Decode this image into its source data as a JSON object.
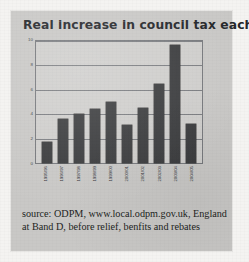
{
  "figure": {
    "title": "Real increase in council tax each year",
    "caption_line_1": "source: ODPM, www.local.odpm.gov.uk, England",
    "caption_line_2": "at Band D, before relief, benfits and rebates"
  },
  "colors": {
    "bar": "#3b3c3e",
    "plot_background": "#cfcecc",
    "figure_background": "#c9c8c6",
    "gridline": "#7b7d81",
    "text": "#1d1f22"
  },
  "chart_data": {
    "type": "bar",
    "title": "Real increase in council tax each year",
    "xlabel": "",
    "ylabel": "",
    "ylim": [
      0,
      10
    ],
    "yticks": [
      0,
      2,
      4,
      6,
      8,
      10
    ],
    "grid": true,
    "legend": "none",
    "categories": [
      "1995/96",
      "1996/97",
      "1997/98",
      "1998/99",
      "1999/00",
      "2000/01",
      "2001/02",
      "2002/03",
      "2003/04",
      "2004/05"
    ],
    "values": [
      1.7,
      3.6,
      4.0,
      4.4,
      5.0,
      3.1,
      4.5,
      6.5,
      9.7,
      3.2
    ]
  }
}
